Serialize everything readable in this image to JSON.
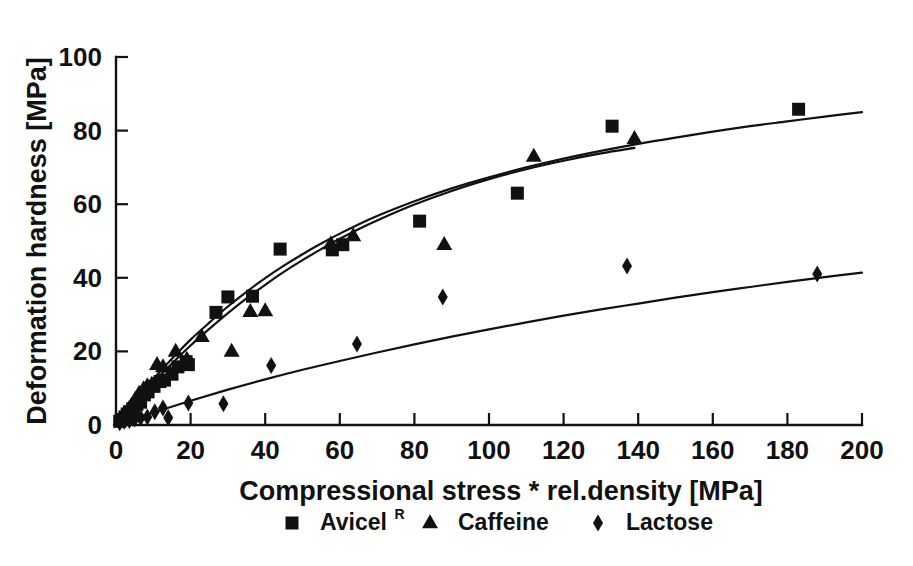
{
  "chart_data": {
    "type": "scatter",
    "title": "",
    "subtitle": "",
    "xlabel": "Compressional stress * rel.density [MPa]",
    "ylabel": "Deformation hardness [MPa]",
    "xlim": [
      0,
      200
    ],
    "ylim": [
      0,
      100
    ],
    "xticks": [
      0,
      20,
      40,
      60,
      80,
      100,
      120,
      140,
      160,
      180,
      200
    ],
    "yticks": [
      0,
      20,
      40,
      60,
      80,
      100
    ],
    "xtick_labels": [
      "0",
      "20",
      "40",
      "60",
      "80",
      "100",
      "120",
      "140",
      "160",
      "180",
      "200"
    ],
    "ytick_labels": [
      "0",
      "20",
      "40",
      "60",
      "80",
      "100"
    ],
    "grid": false,
    "legend_position": "below-bottom-center",
    "marker_colors": {
      "avicel": "#111111",
      "caffeine": "#111111",
      "lactose": "#111111"
    },
    "series": [
      {
        "name": "Avicel",
        "name_superscript": "R",
        "marker": "square",
        "points": [
          [
            1.0,
            1.0
          ],
          [
            1.8,
            1.5
          ],
          [
            2.4,
            2.2
          ],
          [
            3.0,
            3.0
          ],
          [
            3.6,
            3.6
          ],
          [
            4.5,
            4.4
          ],
          [
            5.6,
            5.6
          ],
          [
            6.6,
            6.2
          ],
          [
            7.6,
            8.2
          ],
          [
            8.6,
            9.0
          ],
          [
            10.2,
            10.5
          ],
          [
            11.8,
            11.8
          ],
          [
            13.0,
            12.2
          ],
          [
            15.0,
            13.8
          ],
          [
            16.6,
            15.8
          ],
          [
            18.8,
            17.2
          ],
          [
            19.4,
            16.4
          ],
          [
            26.8,
            30.6
          ],
          [
            30.0,
            34.8
          ],
          [
            36.6,
            35.0
          ],
          [
            44.0,
            47.8
          ],
          [
            58.0,
            47.6
          ],
          [
            60.8,
            49.0
          ],
          [
            81.4,
            55.4
          ],
          [
            107.6,
            63.0
          ],
          [
            133.0,
            81.2
          ],
          [
            183.0,
            85.8
          ]
        ]
      },
      {
        "name": "Caffeine",
        "marker": "triangle",
        "points": [
          [
            1.2,
            1.4
          ],
          [
            2.0,
            2.6
          ],
          [
            2.8,
            3.4
          ],
          [
            3.6,
            4.6
          ],
          [
            4.4,
            5.6
          ],
          [
            5.2,
            7.0
          ],
          [
            6.2,
            8.6
          ],
          [
            7.4,
            9.8
          ],
          [
            8.4,
            10.6
          ],
          [
            9.6,
            11.0
          ],
          [
            11.0,
            16.4
          ],
          [
            12.6,
            15.8
          ],
          [
            14.6,
            13.8
          ],
          [
            16.0,
            20.0
          ],
          [
            19.0,
            17.8
          ],
          [
            23.0,
            24.0
          ],
          [
            31.0,
            20.0
          ],
          [
            36.0,
            30.8
          ],
          [
            40.0,
            31.0
          ],
          [
            57.6,
            49.2
          ],
          [
            63.6,
            51.4
          ],
          [
            88.0,
            49.0
          ],
          [
            112.0,
            73.0
          ],
          [
            139.0,
            77.8
          ]
        ]
      },
      {
        "name": "Lactose",
        "marker": "diamond",
        "points": [
          [
            1.0,
            0.6
          ],
          [
            2.2,
            1.0
          ],
          [
            3.6,
            1.2
          ],
          [
            5.0,
            1.6
          ],
          [
            6.6,
            2.0
          ],
          [
            8.4,
            2.2
          ],
          [
            10.4,
            3.6
          ],
          [
            12.6,
            4.6
          ],
          [
            14.0,
            2.0
          ],
          [
            19.4,
            6.0
          ],
          [
            28.8,
            5.8
          ],
          [
            41.6,
            16.2
          ],
          [
            64.6,
            22.0
          ],
          [
            87.6,
            34.8
          ],
          [
            137.0,
            43.2
          ],
          [
            188.0,
            41.0
          ]
        ]
      }
    ],
    "fit_curves": [
      {
        "name": "Avicel fit",
        "x_range": [
          0,
          200
        ],
        "points": [
          [
            0,
            0
          ],
          [
            5,
            6.5
          ],
          [
            10,
            12.5
          ],
          [
            15,
            18.0
          ],
          [
            20,
            23.2
          ],
          [
            25,
            27.8
          ],
          [
            30,
            32.2
          ],
          [
            35,
            36.2
          ],
          [
            40,
            39.9
          ],
          [
            45,
            43.3
          ],
          [
            50,
            46.4
          ],
          [
            55,
            49.3
          ],
          [
            60,
            52.0
          ],
          [
            65,
            54.5
          ],
          [
            70,
            56.8
          ],
          [
            80,
            60.8
          ],
          [
            90,
            64.3
          ],
          [
            100,
            67.3
          ],
          [
            110,
            70.0
          ],
          [
            120,
            72.4
          ],
          [
            130,
            74.5
          ],
          [
            140,
            76.4
          ],
          [
            150,
            78.1
          ],
          [
            160,
            79.7
          ],
          [
            170,
            81.2
          ],
          [
            180,
            82.5
          ],
          [
            190,
            83.8
          ],
          [
            200,
            85.0
          ]
        ]
      },
      {
        "name": "Caffeine fit",
        "x_range": [
          0,
          139
        ],
        "points": [
          [
            0,
            0
          ],
          [
            5,
            5.9
          ],
          [
            10,
            11.5
          ],
          [
            15,
            16.7
          ],
          [
            20,
            21.6
          ],
          [
            25,
            26.1
          ],
          [
            30,
            30.4
          ],
          [
            35,
            34.4
          ],
          [
            40,
            38.1
          ],
          [
            45,
            41.6
          ],
          [
            50,
            44.8
          ],
          [
            55,
            47.8
          ],
          [
            60,
            50.6
          ],
          [
            65,
            53.2
          ],
          [
            70,
            55.6
          ],
          [
            80,
            59.9
          ],
          [
            90,
            63.6
          ],
          [
            100,
            66.8
          ],
          [
            110,
            69.5
          ],
          [
            120,
            71.8
          ],
          [
            130,
            73.8
          ],
          [
            139,
            75.3
          ]
        ]
      },
      {
        "name": "Lactose fit",
        "x_range": [
          0,
          200
        ],
        "points": [
          [
            0,
            0
          ],
          [
            10,
            3.4
          ],
          [
            20,
            6.6
          ],
          [
            30,
            9.6
          ],
          [
            40,
            12.4
          ],
          [
            50,
            15.0
          ],
          [
            60,
            17.4
          ],
          [
            70,
            19.7
          ],
          [
            80,
            21.9
          ],
          [
            90,
            24.0
          ],
          [
            100,
            26.0
          ],
          [
            110,
            27.9
          ],
          [
            120,
            29.7
          ],
          [
            130,
            31.4
          ],
          [
            140,
            33.0
          ],
          [
            150,
            34.6
          ],
          [
            160,
            36.1
          ],
          [
            170,
            37.5
          ],
          [
            180,
            38.9
          ],
          [
            190,
            40.2
          ],
          [
            200,
            41.4
          ]
        ]
      }
    ],
    "legend": [
      {
        "label": "Avicel",
        "superscript": "R",
        "marker": "square"
      },
      {
        "label": "Caffeine",
        "superscript": "",
        "marker": "triangle"
      },
      {
        "label": "Lactose",
        "superscript": "",
        "marker": "diamond"
      }
    ]
  }
}
